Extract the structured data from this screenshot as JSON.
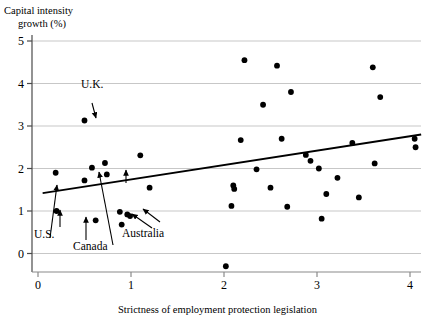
{
  "chart_data": {
    "type": "scatter",
    "title": "",
    "ylabel": "Capital intensity\ngrowth (%)",
    "ylabel_line1": "Capital intensity",
    "ylabel_line2": "growth (%)",
    "xlabel": "Strictness of employment protection legislation",
    "xlim": [
      -0.05,
      4.3
    ],
    "ylim": [
      -0.55,
      5.25
    ],
    "xticks": [
      0,
      1,
      2,
      3,
      4
    ],
    "yticks": [
      0,
      1,
      2,
      3,
      4,
      5
    ],
    "xticklabels": [
      "0",
      "1",
      "2",
      "3",
      "4"
    ],
    "yticklabels": [
      "0",
      "1",
      "2",
      "3",
      "4",
      "5"
    ],
    "grid": "horizontal",
    "legend": "none",
    "points": [
      {
        "x": 0.19,
        "y": 1.9
      },
      {
        "x": 0.2,
        "y": 1.0
      },
      {
        "x": 0.5,
        "y": 3.13
      },
      {
        "x": 0.5,
        "y": 1.72
      },
      {
        "x": 0.58,
        "y": 2.02
      },
      {
        "x": 0.62,
        "y": 0.78
      },
      {
        "x": 0.72,
        "y": 2.13
      },
      {
        "x": 0.74,
        "y": 1.86
      },
      {
        "x": 0.88,
        "y": 0.98
      },
      {
        "x": 0.9,
        "y": 0.68
      },
      {
        "x": 0.96,
        "y": 0.92
      },
      {
        "x": 0.99,
        "y": 0.88
      },
      {
        "x": 1.1,
        "y": 2.31
      },
      {
        "x": 1.2,
        "y": 1.55
      },
      {
        "x": 2.02,
        "y": -0.3
      },
      {
        "x": 2.08,
        "y": 1.12
      },
      {
        "x": 2.1,
        "y": 1.6
      },
      {
        "x": 2.11,
        "y": 1.52
      },
      {
        "x": 2.18,
        "y": 2.67
      },
      {
        "x": 2.22,
        "y": 4.55
      },
      {
        "x": 2.35,
        "y": 1.98
      },
      {
        "x": 2.42,
        "y": 3.5
      },
      {
        "x": 2.5,
        "y": 1.55
      },
      {
        "x": 2.57,
        "y": 4.42
      },
      {
        "x": 2.62,
        "y": 2.7
      },
      {
        "x": 2.68,
        "y": 1.1
      },
      {
        "x": 2.72,
        "y": 3.8
      },
      {
        "x": 2.88,
        "y": 2.32
      },
      {
        "x": 2.93,
        "y": 2.18
      },
      {
        "x": 3.02,
        "y": 2.0
      },
      {
        "x": 3.05,
        "y": 0.82
      },
      {
        "x": 3.1,
        "y": 1.4
      },
      {
        "x": 3.22,
        "y": 1.78
      },
      {
        "x": 3.38,
        "y": 2.6
      },
      {
        "x": 3.45,
        "y": 1.32
      },
      {
        "x": 3.6,
        "y": 4.38
      },
      {
        "x": 3.62,
        "y": 2.12
      },
      {
        "x": 3.68,
        "y": 3.68
      },
      {
        "x": 4.05,
        "y": 2.7
      },
      {
        "x": 4.06,
        "y": 2.5
      }
    ],
    "trendline": {
      "x0": 0.05,
      "y0": 1.42,
      "x1": 4.12,
      "y1": 2.8
    },
    "annotations": [
      {
        "label": "U.K.",
        "label_x": 81,
        "label_y": 88,
        "arrow": [
          [
            92,
            103
          ],
          [
            96,
            118
          ]
        ]
      },
      {
        "label": "U.S.",
        "label_x": 34,
        "label_y": 238,
        "arrow": [
          [
            50,
            238
          ],
          [
            57,
            185
          ]
        ]
      },
      {
        "label": "Canada",
        "label_x": 73,
        "label_y": 250,
        "arrow": [
          [
            113,
            245
          ],
          [
            99,
            172
          ]
        ]
      },
      {
        "label": "Australia",
        "label_x": 122,
        "label_y": 237,
        "arrow": [
          [
            152,
            228
          ],
          [
            132,
            214
          ]
        ]
      }
    ],
    "extra_arrows": [
      {
        "from": [
          60,
          227
        ],
        "to": [
          60,
          210
        ]
      },
      {
        "from": [
          86,
          240
        ],
        "to": [
          86,
          217
        ]
      },
      {
        "from": [
          126,
          183
        ],
        "to": [
          126,
          170
        ]
      },
      {
        "from": [
          160,
          222
        ],
        "to": [
          143,
          209
        ]
      }
    ]
  }
}
